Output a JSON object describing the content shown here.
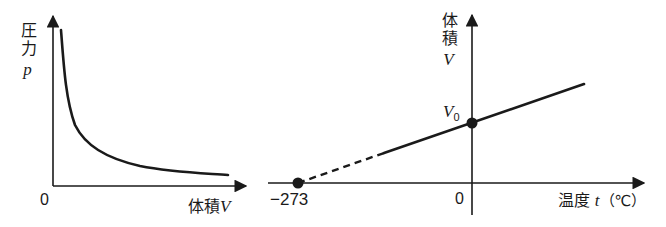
{
  "left_graph": {
    "title": "Boyle's law (pressure vs volume)",
    "y_label_text": "圧力",
    "y_label_symbol": "p",
    "x_label_text": "体積",
    "x_label_symbol": "V",
    "origin_label": "0",
    "curve_type": "inverse proportion (hyperbola)"
  },
  "right_graph": {
    "title": "Charles's law (volume vs temperature)",
    "y_label_text": "体積",
    "y_label_symbol": "V",
    "x_label_text": "温度",
    "x_label_symbol": "t",
    "x_label_unit": "（℃）",
    "origin_label": "0",
    "intercept_x_label": "−273",
    "intercept_y_label": "V",
    "intercept_y_sub": "0"
  },
  "colors": {
    "line": "#1a1a1a",
    "background": "#ffffff"
  }
}
